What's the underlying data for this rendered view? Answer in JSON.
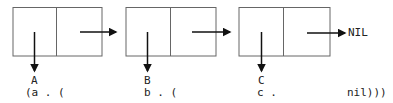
{
  "diagram": {
    "cells": [
      {
        "id": "cell-1",
        "car_label": "A",
        "expr": "(a . ("
      },
      {
        "id": "cell-2",
        "car_label": "B",
        "expr": "b . ("
      },
      {
        "id": "cell-3",
        "car_label": "C",
        "expr": "c ."
      }
    ],
    "terminal": "NIL",
    "closing_expr": "nil)))",
    "colors": {
      "stroke": "#555555",
      "arrow": "#111111",
      "text": "#222222"
    }
  }
}
